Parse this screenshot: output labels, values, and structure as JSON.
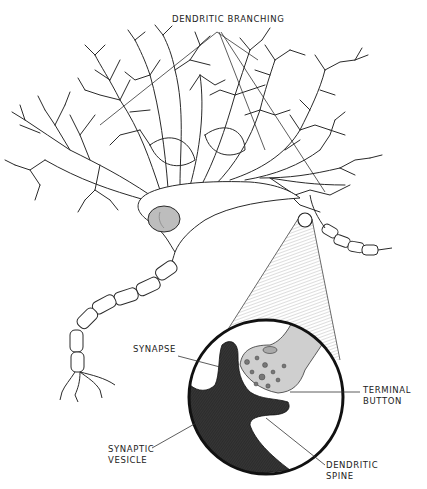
{
  "diagram": {
    "labels": {
      "dendritic_branching": "DENDRITIC BRANCHING",
      "synapse": "SYNAPSE",
      "terminal_button": [
        "TERMINAL",
        "BUTTON"
      ],
      "synaptic_vesicle": [
        "SYNAPTIC",
        "VESICLE"
      ],
      "dendritic_spine": [
        "DENDRITIC",
        "SPINE"
      ]
    },
    "parts": [
      "dendrites",
      "cell-body",
      "nucleus",
      "axon",
      "myelin-sheath",
      "axon-terminals",
      "synapse-magnifier",
      "terminal-button",
      "synaptic-vesicles",
      "dendritic-spine"
    ],
    "colors": {
      "ink": "#2a2a2a",
      "spine_fill": "#333333",
      "terminal_fill": "#cfcfcf",
      "nucleus_fill": "#bdbdbd",
      "cone_fill": "#d8d8d8",
      "background": "#ffffff"
    }
  }
}
